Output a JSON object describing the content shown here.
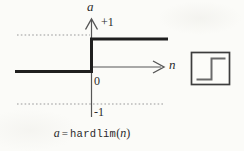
{
  "figure": {
    "y_axis_label": "a",
    "x_axis_label": "n",
    "origin_label": "0",
    "upper_level_label": "+1",
    "lower_level_label": "-1",
    "caption": {
      "lhs": "a",
      "equals": "=",
      "function": "hardlim",
      "paren_open": "(",
      "arg": "n",
      "paren_close": ")"
    },
    "function_segments": [
      {
        "domain": "n < 0",
        "value": 0
      },
      {
        "domain": "n >= 0",
        "value": 1
      }
    ],
    "colors": {
      "function_line": "#1f1f1f",
      "axis_line": "#565656",
      "dotted_guide": "#9a9a9a",
      "icon_border": "#3d3d3d",
      "icon_step": "#6a6a6a",
      "background": "#fbfbf8"
    }
  }
}
